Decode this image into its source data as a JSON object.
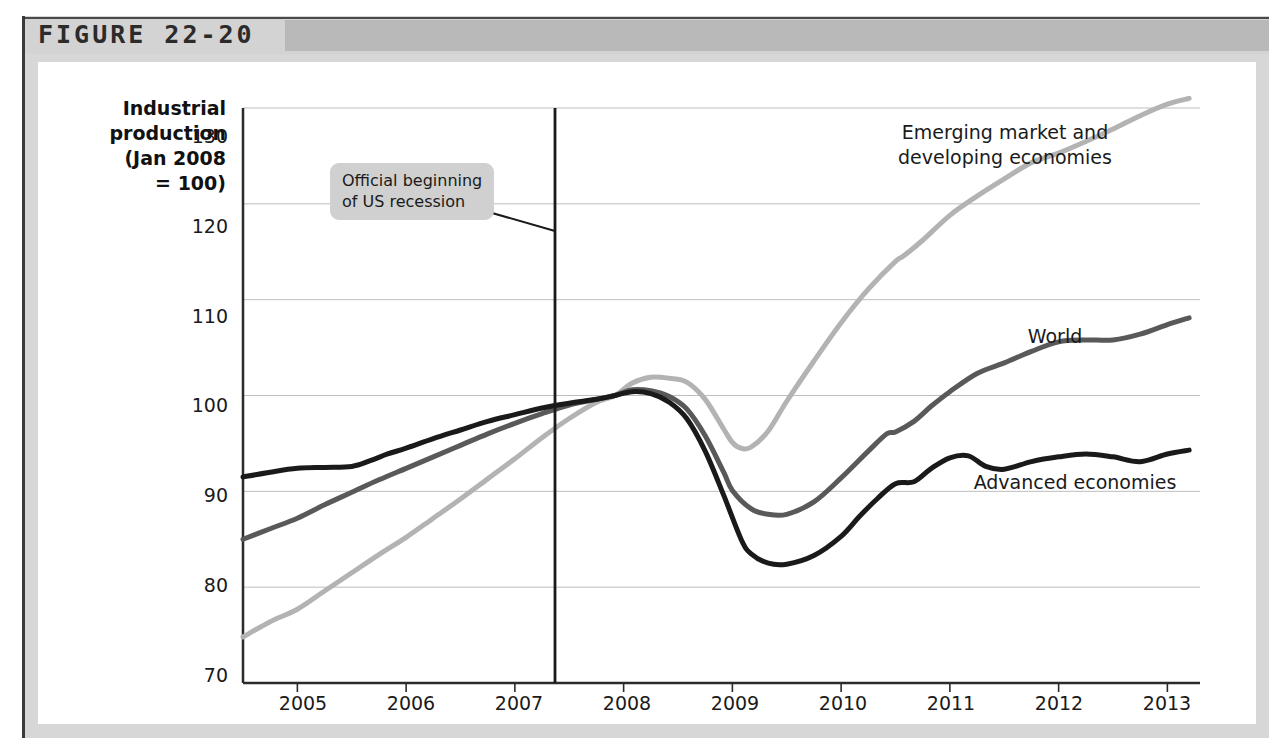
{
  "figure": {
    "number_label": "FIGURE 22-20"
  },
  "chart_data": {
    "type": "line",
    "title": "",
    "ylabel": "Industrial\nproduction\n(Jan 2008\n= 100)",
    "xlabel": "",
    "ylim": [
      70,
      130
    ],
    "xlim": [
      2004.5,
      2013.3
    ],
    "yticks": [
      "70",
      "80",
      "90",
      "100",
      "110",
      "120",
      "130"
    ],
    "ytick_values": [
      70,
      80,
      90,
      100,
      110,
      120,
      130
    ],
    "xticks": [
      "2005",
      "2006",
      "2007",
      "2008",
      "2009",
      "2010",
      "2011",
      "2012",
      "2013"
    ],
    "xtick_values": [
      2005,
      2006,
      2007,
      2008,
      2009,
      2010,
      2011,
      2012,
      2013
    ],
    "grid": "horizontal",
    "legend_position": "inline-labels",
    "annotations": [
      {
        "name": "recession-marker",
        "text": "Official beginning\nof US recession",
        "x_value": 2007.92,
        "type": "vertical-line-with-callout"
      }
    ],
    "series": [
      {
        "name": "Emerging market and\ndeveloping economies",
        "label_plain": "Emerging market and developing economies",
        "color": "#b3b3b3",
        "x": [
          2004.5,
          2004.75,
          2005.0,
          2005.25,
          2005.5,
          2005.75,
          2006.0,
          2006.25,
          2006.5,
          2006.75,
          2007.0,
          2007.25,
          2007.5,
          2007.75,
          2007.92,
          2008.08,
          2008.25,
          2008.42,
          2008.58,
          2008.75,
          2008.92,
          2009.0,
          2009.08,
          2009.17,
          2009.33,
          2009.5,
          2009.75,
          2010.0,
          2010.25,
          2010.5,
          2010.58,
          2010.75,
          2011.0,
          2011.25,
          2011.5,
          2011.75,
          2012.0,
          2012.25,
          2012.5,
          2012.75,
          2013.0,
          2013.2
        ],
        "y": [
          74.8,
          76.4,
          77.7,
          79.6,
          81.5,
          83.4,
          85.2,
          87.2,
          89.2,
          91.3,
          93.4,
          95.6,
          97.6,
          99.3,
          100.0,
          101.3,
          101.9,
          101.8,
          101.4,
          99.6,
          96.5,
          95.1,
          94.5,
          94.6,
          96.3,
          99.4,
          103.6,
          107.6,
          111.1,
          114.0,
          114.6,
          116.2,
          118.8,
          120.8,
          122.6,
          124.3,
          125.3,
          126.5,
          127.8,
          129.2,
          130.4,
          131.0
        ]
      },
      {
        "name": "World",
        "label_plain": "World",
        "color": "#595959",
        "x": [
          2004.5,
          2004.75,
          2005.0,
          2005.25,
          2005.5,
          2005.75,
          2006.0,
          2006.25,
          2006.5,
          2006.75,
          2007.0,
          2007.25,
          2007.5,
          2007.75,
          2007.92,
          2008.08,
          2008.25,
          2008.42,
          2008.58,
          2008.75,
          2008.92,
          2009.0,
          2009.17,
          2009.33,
          2009.5,
          2009.75,
          2010.0,
          2010.25,
          2010.42,
          2010.5,
          2010.67,
          2010.83,
          2011.0,
          2011.25,
          2011.5,
          2011.75,
          2012.0,
          2012.25,
          2012.5,
          2012.75,
          2013.0,
          2013.2
        ],
        "y": [
          85.0,
          86.1,
          87.2,
          88.6,
          89.9,
          91.2,
          92.4,
          93.6,
          94.8,
          96.0,
          97.1,
          98.1,
          99.0,
          99.6,
          100.0,
          100.6,
          100.5,
          99.9,
          98.6,
          95.8,
          92.0,
          90.1,
          88.2,
          87.6,
          87.6,
          88.9,
          91.4,
          94.2,
          96.0,
          96.2,
          97.3,
          98.9,
          100.4,
          102.3,
          103.4,
          104.6,
          105.6,
          105.8,
          105.8,
          106.4,
          107.4,
          108.1
        ]
      },
      {
        "name": "Advanced economies",
        "label_plain": "Advanced economies",
        "color": "#1a1a1a",
        "x": [
          2004.5,
          2004.75,
          2005.0,
          2005.25,
          2005.5,
          2005.67,
          2005.83,
          2006.0,
          2006.25,
          2006.5,
          2006.75,
          2007.0,
          2007.25,
          2007.5,
          2007.75,
          2007.92,
          2008.08,
          2008.25,
          2008.42,
          2008.58,
          2008.75,
          2008.92,
          2009.08,
          2009.17,
          2009.33,
          2009.5,
          2009.75,
          2010.0,
          2010.17,
          2010.33,
          2010.5,
          2010.67,
          2010.83,
          2011.0,
          2011.17,
          2011.33,
          2011.5,
          2011.75,
          2012.0,
          2012.25,
          2012.5,
          2012.75,
          2013.0,
          2013.2
        ],
        "y": [
          91.5,
          92.0,
          92.4,
          92.5,
          92.6,
          93.2,
          93.9,
          94.5,
          95.5,
          96.4,
          97.3,
          98.0,
          98.7,
          99.2,
          99.6,
          100.0,
          100.4,
          100.2,
          99.3,
          97.6,
          94.2,
          89.6,
          85.0,
          83.5,
          82.5,
          82.4,
          83.3,
          85.3,
          87.4,
          89.2,
          90.8,
          91.0,
          92.4,
          93.5,
          93.7,
          92.6,
          92.3,
          93.1,
          93.6,
          93.9,
          93.6,
          93.1,
          93.9,
          94.3
        ]
      }
    ]
  }
}
